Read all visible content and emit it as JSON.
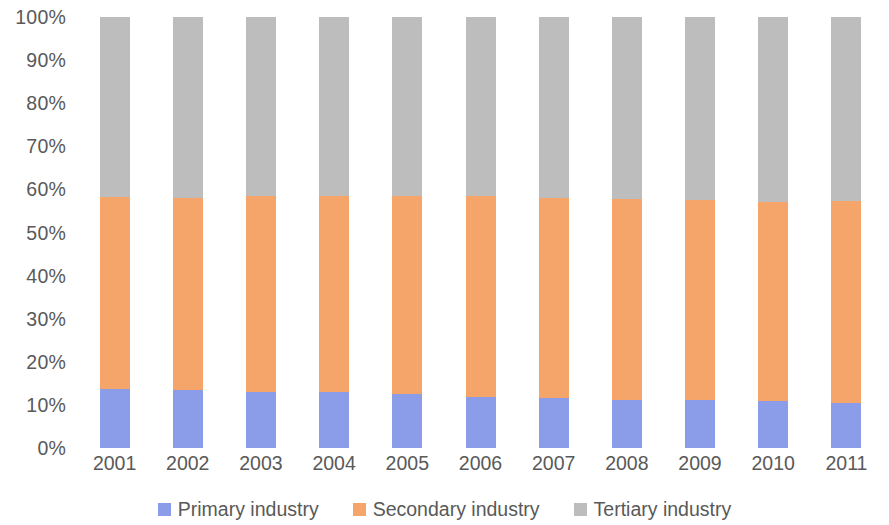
{
  "chart_data": {
    "type": "bar",
    "stacked": true,
    "stack_mode": "percent",
    "title": "",
    "subtitle": "",
    "xlabel": "",
    "ylabel": "",
    "categories": [
      "2001",
      "2002",
      "2003",
      "2004",
      "2005",
      "2006",
      "2007",
      "2008",
      "2009",
      "2010",
      "2011"
    ],
    "series": [
      {
        "name": "Primary industry",
        "color": "#8b9de8",
        "values": [
          13.7,
          13.5,
          13.0,
          13.0,
          12.5,
          11.8,
          11.6,
          11.1,
          11.1,
          10.9,
          10.4
        ]
      },
      {
        "name": "Secondary industry",
        "color": "#f5a46a",
        "values": [
          44.6,
          44.5,
          45.5,
          45.5,
          46.0,
          46.6,
          46.4,
          46.6,
          46.4,
          46.2,
          46.8
        ]
      },
      {
        "name": "Tertiary industry",
        "color": "#bdbdbd",
        "values": [
          41.7,
          42.0,
          41.5,
          41.5,
          41.5,
          41.6,
          42.0,
          42.3,
          42.5,
          42.9,
          42.8
        ]
      }
    ],
    "ylim": [
      0,
      100
    ],
    "ytick_labels": [
      "100%",
      "90%",
      "80%",
      "70%",
      "60%",
      "50%",
      "40%",
      "30%",
      "20%",
      "10%",
      "0%"
    ],
    "ytick_values": [
      100,
      90,
      80,
      70,
      60,
      50,
      40,
      30,
      20,
      10,
      0
    ],
    "grid": false,
    "legend_position": "bottom",
    "axis_text_color": "#595959"
  }
}
